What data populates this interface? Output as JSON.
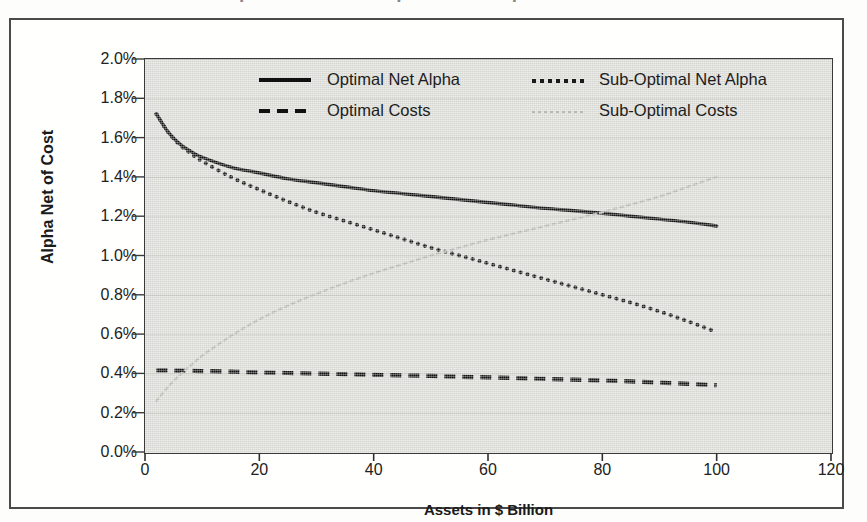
{
  "figure": {
    "title_partial": "Optimal and Sub-Optimal Net Alpha and Costs",
    "y_axis_title": "Alpha Net of Cost",
    "x_axis_title": "Assets in $ Billion"
  },
  "legend": {
    "entries": [
      {
        "label": "Optimal Net Alpha",
        "style": "solid",
        "color": "#111111",
        "swatch_class": "sw-solid"
      },
      {
        "label": "Sub-Optimal Net Alpha",
        "style": "dotted",
        "color": "#1b1b1b",
        "swatch_class": "sw-dot"
      },
      {
        "label": "Optimal Costs",
        "style": "dashed",
        "color": "#111111",
        "swatch_class": "sw-dash"
      },
      {
        "label": "Sub-Optimal Costs",
        "style": "dotted",
        "color": "#b9b9b4",
        "swatch_class": "sw-graydot"
      }
    ]
  },
  "chart_data": {
    "type": "line",
    "title": "Optimal and Sub-Optimal Net Alpha and Costs",
    "xlabel": "Assets in $ Billion",
    "ylabel": "Alpha Net of Cost",
    "xlim": [
      0,
      120
    ],
    "ylim": [
      0,
      0.02
    ],
    "xticks": [
      0,
      20,
      40,
      60,
      80,
      100,
      120
    ],
    "xtick_labels": [
      "0",
      "20",
      "40",
      "60",
      "80",
      "100",
      "120"
    ],
    "yticks": [
      0,
      0.002,
      0.004,
      0.006,
      0.008,
      0.01,
      0.012,
      0.014,
      0.016,
      0.018,
      0.02
    ],
    "ytick_labels": [
      "0.0%",
      "0.2%",
      "0.4%",
      "0.6%",
      "0.8%",
      "1.0%",
      "1.2%",
      "1.4%",
      "1.6%",
      "1.8%",
      "2.0%"
    ],
    "y_value_format": "percent",
    "grid": "horizontal",
    "legend_position": "top-center-inside",
    "plot_background": "#dcdcd8",
    "x": [
      2,
      4,
      6,
      8,
      10,
      15,
      20,
      25,
      30,
      35,
      40,
      45,
      50,
      55,
      60,
      65,
      70,
      75,
      80,
      85,
      90,
      95,
      100
    ],
    "series": [
      {
        "name": "Optimal Net Alpha",
        "style": "solid",
        "color": "#111111",
        "values": [
          1.72,
          1.63,
          1.57,
          1.53,
          1.5,
          1.45,
          1.42,
          1.39,
          1.37,
          1.35,
          1.33,
          1.315,
          1.3,
          1.285,
          1.27,
          1.255,
          1.24,
          1.228,
          1.215,
          1.2,
          1.185,
          1.17,
          1.15
        ],
        "unit": "%"
      },
      {
        "name": "Sub-Optimal Net Alpha",
        "style": "dotted",
        "color": "#1b1b1b",
        "values": [
          1.72,
          1.63,
          1.565,
          1.52,
          1.48,
          1.4,
          1.335,
          1.275,
          1.22,
          1.175,
          1.13,
          1.085,
          1.04,
          1.0,
          0.96,
          0.92,
          0.88,
          0.84,
          0.8,
          0.76,
          0.715,
          0.665,
          0.61
        ],
        "unit": "%"
      },
      {
        "name": "Optimal Costs",
        "style": "dashed",
        "color": "#111111",
        "values": [
          0.415,
          0.415,
          0.414,
          0.413,
          0.412,
          0.409,
          0.405,
          0.402,
          0.399,
          0.396,
          0.393,
          0.39,
          0.387,
          0.383,
          0.38,
          0.376,
          0.372,
          0.368,
          0.364,
          0.359,
          0.353,
          0.347,
          0.34
        ],
        "unit": "%"
      },
      {
        "name": "Sub-Optimal Costs",
        "style": "dotted",
        "color": "#b9b9b4",
        "values": [
          0.26,
          0.33,
          0.39,
          0.44,
          0.49,
          0.59,
          0.675,
          0.745,
          0.805,
          0.86,
          0.91,
          0.955,
          1.0,
          1.04,
          1.08,
          1.115,
          1.15,
          1.185,
          1.22,
          1.26,
          1.3,
          1.35,
          1.4
        ],
        "unit": "%"
      }
    ],
    "annotations": [
      {
        "text": "Sub-Optimal Costs crosses Optimal Costs",
        "x": 8,
        "y": 0.00413
      },
      {
        "text": "Sub-Optimal Costs crosses Sub-Optimal Net Alpha",
        "x": 50,
        "y": 0.0102
      },
      {
        "text": "Sub-Optimal Costs crosses Optimal Net Alpha",
        "x": 72,
        "y": 0.0123
      }
    ]
  }
}
